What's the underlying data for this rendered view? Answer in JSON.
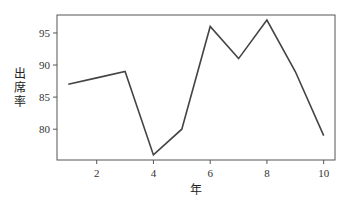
{
  "chart_data": {
    "type": "line",
    "title": "",
    "xlabel": "年",
    "ylabel": "出席率",
    "x": [
      1,
      2,
      3,
      4,
      5,
      6,
      7,
      8,
      9,
      10
    ],
    "series": [
      {
        "name": "出席率",
        "values": [
          87,
          88,
          89,
          76,
          80,
          96,
          91,
          97,
          89,
          79
        ],
        "color": "#444444"
      }
    ],
    "xticks": [
      2,
      4,
      6,
      8,
      10
    ],
    "yticks": [
      80,
      85,
      90,
      95
    ],
    "xlim": [
      0.6,
      10.4
    ],
    "ylim": [
      75.2,
      97.8
    ],
    "grid": false,
    "legend": false
  }
}
